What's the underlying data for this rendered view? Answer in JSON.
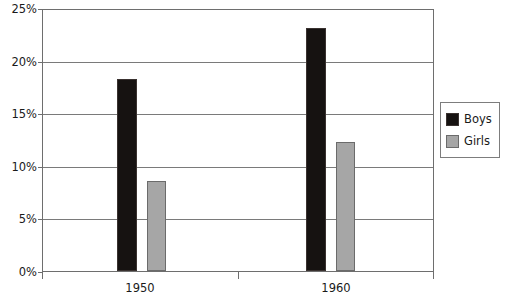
{
  "chart_data": {
    "type": "bar",
    "title": "",
    "subtitle": "",
    "xlabel": "",
    "ylabel": "",
    "categories": [
      "1950",
      "1960"
    ],
    "series": [
      {
        "name": "Boys",
        "values": [
          18.4,
          23.3
        ],
        "color": "#161211"
      },
      {
        "name": "Girls",
        "values": [
          8.6,
          12.4
        ],
        "color": "#a6a6a6"
      }
    ],
    "ylim": [
      0,
      25
    ],
    "yticks": [
      0,
      5,
      10,
      15,
      20,
      25
    ],
    "ytick_labels": [
      "0%",
      "5%",
      "10%",
      "15%",
      "20%",
      "25%"
    ],
    "value_format": "percent",
    "grid": true,
    "grid_axis": "y",
    "legend_position": "right",
    "legend": [
      "Boys",
      "Girls"
    ],
    "annotations": []
  },
  "axes": {
    "y": {
      "ticks": [
        {
          "label": "25%",
          "value": 25
        },
        {
          "label": "20%",
          "value": 20
        },
        {
          "label": "15%",
          "value": 15
        },
        {
          "label": "10%",
          "value": 10
        },
        {
          "label": "5%",
          "value": 5
        },
        {
          "label": "0%",
          "value": 0
        }
      ]
    },
    "x": {
      "ticks": [
        {
          "label": "1950"
        },
        {
          "label": "1960"
        }
      ]
    }
  },
  "legend": {
    "items": [
      {
        "label": "Boys",
        "color": "#161211"
      },
      {
        "label": "Girls",
        "color": "#a6a6a6"
      }
    ]
  }
}
